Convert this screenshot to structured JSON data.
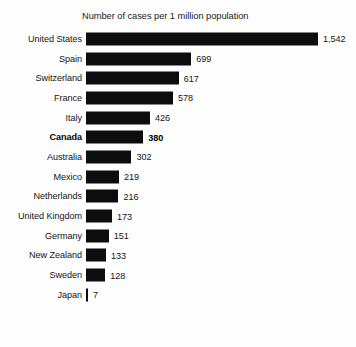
{
  "chart_data": {
    "type": "bar",
    "title": "Number of cases per 1 million population",
    "xlabel": "",
    "ylabel": "",
    "orientation": "horizontal",
    "grid": false,
    "legend": false,
    "xlim": [
      0,
      1542
    ],
    "categories": [
      "United States",
      "Spain",
      "Switzerland",
      "France",
      "Italy",
      "Canada",
      "Australia",
      "Mexico",
      "Netherlands",
      "United Kingdom",
      "Germany",
      "New Zealand",
      "Sweden",
      "Japan"
    ],
    "values": [
      1542,
      699,
      617,
      578,
      426,
      380,
      302,
      219,
      216,
      173,
      151,
      133,
      128,
      7
    ],
    "value_labels": [
      "1,542",
      "699",
      "617",
      "578",
      "426",
      "380",
      "302",
      "219",
      "216",
      "173",
      "151",
      "133",
      "128",
      "7"
    ],
    "highlight_category": "Canada",
    "bar_color": "#0d0d0d",
    "background_color": "#ffffff",
    "text_color": "#141414"
  }
}
